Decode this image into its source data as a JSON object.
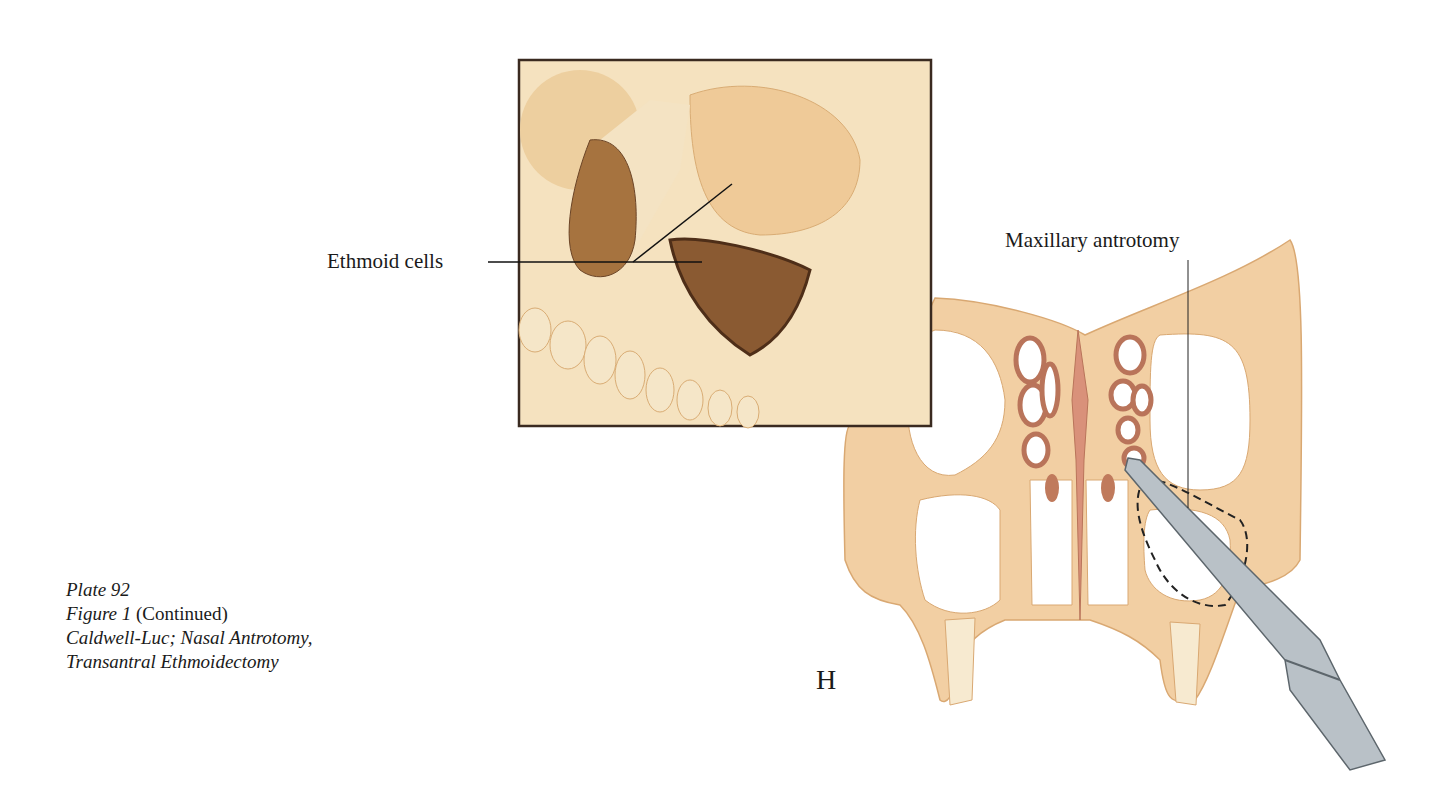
{
  "caption": {
    "plate": "Plate 92",
    "figure": "Figure 1",
    "figure_suffix": " (Continued)",
    "line3": "Caldwell-Luc; Nasal Antrotomy,",
    "line4": "Transantral Ethmoidectomy"
  },
  "labels": {
    "ethmoid_cells": "Ethmoid cells",
    "maxillary_antrotomy": "Maxillary antrotomy"
  },
  "panel_letter": "H",
  "colors": {
    "bone": "#f3dcb4",
    "bone_dark": "#e8c08c",
    "section": "#f0c89a",
    "sinus_wall": "#b9745a",
    "cavity": "#8a5a32",
    "instrument": "#a9b2b8",
    "inset_border": "#3a2a20"
  }
}
